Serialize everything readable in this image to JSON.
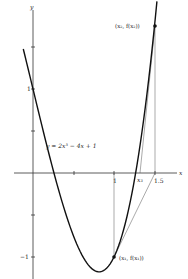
{
  "chart_data": {
    "type": "line",
    "title": "",
    "function_label": "y = 2x³ − 4x + 1",
    "xlabel": "x",
    "ylabel": "y",
    "xlim": [
      -0.4,
      1.85
    ],
    "ylim": [
      -1.25,
      2.05
    ],
    "x_ticks": [
      0.5,
      1,
      1.5
    ],
    "x_tick_labels": {
      "1": "1",
      "1.5": "1.5"
    },
    "y_ticks": [
      -1,
      -0.5,
      0.5,
      1,
      1.5
    ],
    "y_tick_labels": {
      "1": "1",
      "-1": "−1"
    },
    "grid": false,
    "series": [
      {
        "name": "y = 2x^3 - 4x + 1",
        "x_range": [
          -0.12,
          1.53
        ],
        "formula": "2*x^3 - 4*x + 1"
      }
    ],
    "points": [
      {
        "label": "(x₁, f(x₁))",
        "x": 1,
        "y": -1
      },
      {
        "label": "(x₂, f(x₂))",
        "x": 1.5,
        "y": 1.75
      }
    ],
    "annotations": [
      {
        "label": "x₃",
        "x": 1.316,
        "y": 0
      },
      {
        "type": "tangent",
        "from": [
          1,
          -1
        ],
        "to": [
          1.5,
          0
        ]
      },
      {
        "type": "tangent",
        "from": [
          1.5,
          1.75
        ],
        "to": [
          1.316,
          0
        ]
      },
      {
        "type": "vertical",
        "x": 1,
        "from_y": 0,
        "to_y": -1
      },
      {
        "type": "vertical",
        "x": 1.5,
        "from_y": 0,
        "to_y": 1.75
      }
    ]
  },
  "labels": {
    "y_axis": "y",
    "x_axis": "x",
    "tick_y_1": "1",
    "tick_y_neg1": "−1",
    "tick_x_1": "1",
    "tick_x_15": "1.5",
    "x3": "x₃",
    "p1": "(x₁, f(x₁))",
    "p2": "(x₂, f(x₂))",
    "equation": "y = 2x³ − 4x + 1"
  }
}
